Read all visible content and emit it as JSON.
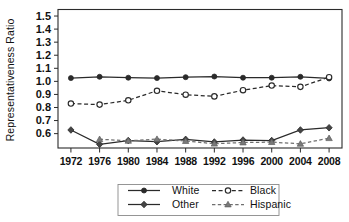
{
  "chart_data": {
    "type": "line",
    "title": "",
    "xlabel": "",
    "ylabel": "Representativeness Ratio",
    "categories": [
      1972,
      1976,
      1980,
      1984,
      1988,
      1992,
      1996,
      2000,
      2004,
      2008
    ],
    "xtick_labels": [
      "1972",
      "1976",
      "1980",
      "1984",
      "1988",
      "1992",
      "1996",
      "2000",
      "2004",
      "2008"
    ],
    "ytick_labels": [
      "1.5",
      "1.4",
      "1.3",
      "1.2",
      "1.1",
      "1.0",
      "0.9",
      "0.8",
      "0.7",
      "0.6"
    ],
    "ytick_values": [
      1.5,
      1.4,
      1.3,
      1.2,
      1.1,
      1.0,
      0.9,
      0.8,
      0.7,
      0.6
    ],
    "ylim": [
      0.49,
      1.55
    ],
    "xlim": [
      1970.2,
      2009.8
    ],
    "grid": "horizontal-dotted",
    "legend_position": "bottom-center",
    "series": [
      {
        "name": "White",
        "marker": "filled-circle",
        "linestyle": "solid",
        "color": "#2a2a2a",
        "values": [
          1.025,
          1.035,
          1.028,
          1.025,
          1.032,
          1.037,
          1.028,
          1.028,
          1.035,
          1.022
        ]
      },
      {
        "name": "Black",
        "marker": "open-circle",
        "linestyle": "dashed",
        "color": "#2a2a2a",
        "values": [
          0.83,
          0.822,
          0.855,
          0.928,
          0.898,
          0.885,
          0.932,
          0.968,
          0.958,
          1.032
        ]
      },
      {
        "name": "Other",
        "marker": "filled-diamond",
        "linestyle": "solid",
        "color": "#444444",
        "values": [
          0.628,
          0.518,
          0.547,
          0.538,
          0.556,
          0.536,
          0.551,
          0.547,
          0.628,
          0.645
        ]
      },
      {
        "name": "Hispanic",
        "marker": "filled-triangle",
        "linestyle": "dashed",
        "color": "#7a7a7a",
        "values": [
          null,
          0.557,
          0.545,
          0.558,
          0.543,
          0.523,
          0.532,
          0.535,
          0.522,
          0.565
        ]
      }
    ]
  },
  "legend": {
    "entries": [
      {
        "label": "White"
      },
      {
        "label": "Black"
      },
      {
        "label": "Other"
      },
      {
        "label": "Hispanic"
      }
    ]
  }
}
